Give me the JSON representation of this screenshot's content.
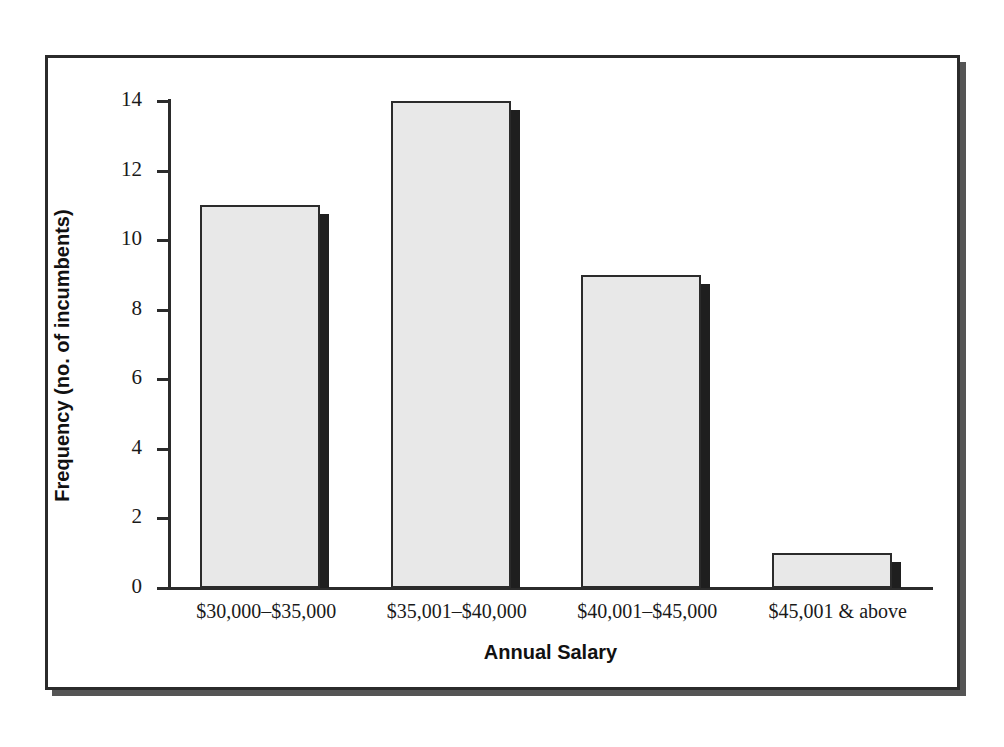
{
  "chart_data": {
    "type": "bar",
    "title": "",
    "subtitle": "",
    "xlabel": "Annual Salary",
    "ylabel": "Frequency (no. of incumbents)",
    "categories": [
      "$30,000–$35,000",
      "$35,001–$40,000",
      "$40,001–$45,000",
      "$45,001 & above"
    ],
    "values": [
      11,
      14,
      9,
      1
    ],
    "ylim": [
      0,
      14
    ],
    "ytick_step": 2,
    "yticks": [
      0,
      2,
      4,
      6,
      8,
      10,
      12,
      14
    ],
    "ytick_labels": [
      "0",
      "2",
      "4",
      "6",
      "8",
      "10",
      "12",
      "14"
    ],
    "grid": false,
    "legend": null,
    "legend_position": "none",
    "annotations": [],
    "bar_style": {
      "fill_color": "#e8e8e8",
      "edge_color": "#2b2b2b",
      "shadow_color": "#1f1f1f",
      "three_d_shadow": true
    }
  },
  "figure": {
    "frame_border_color": "#2b2b2b",
    "frame_shadow_color": "#555555",
    "background_color": "#ffffff",
    "axis_color": "#2b2b2b",
    "text_color": "#1a1a1a"
  }
}
